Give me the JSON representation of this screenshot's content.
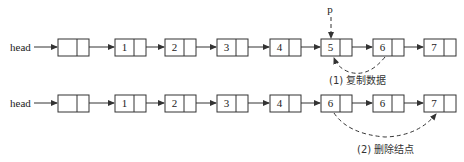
{
  "diagram": {
    "type": "linked-list-deletion",
    "rows": [
      {
        "head_label": "head",
        "nodes": [
          "",
          "1",
          "2",
          "3",
          "4",
          "5",
          "6",
          "7"
        ],
        "pointer": {
          "label": "p",
          "target_index": 5
        },
        "annotation": {
          "label": "(1) 复制数据",
          "from_index": 6,
          "to_index": 5,
          "style": "dashed-arc"
        }
      },
      {
        "head_label": "head",
        "nodes": [
          "",
          "1",
          "2",
          "3",
          "4",
          "6",
          "6",
          "7"
        ],
        "annotation": {
          "label": "(2) 删除结点",
          "from_index": 5,
          "to_index": 7,
          "style": "dashed-arc"
        }
      }
    ]
  }
}
